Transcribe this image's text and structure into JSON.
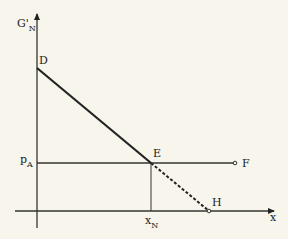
{
  "diagram": {
    "axes": {
      "y_label": "G'",
      "y_label_sub": "N",
      "x_label": "x"
    },
    "points": {
      "D": "D",
      "E": "E",
      "F": "F",
      "H": "H"
    },
    "y_tick": {
      "label": "p",
      "sub": "A"
    },
    "x_tick": {
      "label": "x",
      "sub": "N"
    },
    "segments": [
      {
        "from": "D",
        "to": "E",
        "style": "thick-solid"
      },
      {
        "from": "E",
        "to": "H",
        "style": "dashed"
      },
      {
        "from": "pA",
        "to": "F",
        "style": "solid"
      },
      {
        "from": "E",
        "to": "xN",
        "style": "thin-solid"
      }
    ],
    "colors": {
      "ink": "#222222",
      "background": "#f7f5ec"
    }
  }
}
